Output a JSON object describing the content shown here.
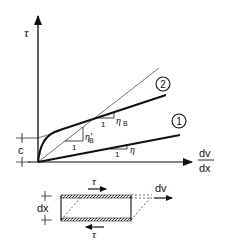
{
  "diagram": {
    "type": "rheology-flow-curve",
    "axes": {
      "y_label": "τ",
      "x_label_numerator": "dv",
      "x_label_denominator": "dx"
    },
    "yield_stress_label": "c",
    "curves": [
      {
        "id": "1",
        "label": "1",
        "description": "Newtonian (linear through origin)",
        "slope_label": "η",
        "run_label": "1"
      },
      {
        "id": "2",
        "label": "2",
        "description": "Bingham-like curve with yield stress c",
        "slope_label": "η",
        "slope_subscript": "B",
        "run_label": "1"
      }
    ],
    "secant": {
      "slope_label": "η'",
      "slope_subscript": "B",
      "run_label": "1"
    },
    "shear_element": {
      "height_label": "dx",
      "top_force_label": "τ",
      "bottom_force_label": "τ",
      "displacement_label": "dv"
    },
    "colors": {
      "ink": "#111111",
      "background": "#ffffff"
    }
  }
}
